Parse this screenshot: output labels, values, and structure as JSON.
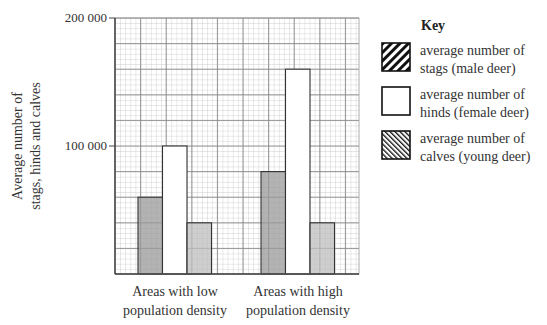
{
  "chart_data": {
    "type": "bar",
    "title": "",
    "xlabel": "",
    "ylabel": "Average number of stags, hinds and calves",
    "ylabel_lines": [
      "Average number of",
      "stags, hinds and calves"
    ],
    "ylim": [
      0,
      200000
    ],
    "yticks": [
      100000,
      200000
    ],
    "ytick_labels": [
      "100 000",
      "200 000"
    ],
    "grid": true,
    "legend_position": "right",
    "categories": [
      "Areas with low population density",
      "Areas with high population density"
    ],
    "category_lines": [
      [
        "Areas with low",
        "population density"
      ],
      [
        "Areas with high",
        "population density"
      ]
    ],
    "series": [
      {
        "name": "average number of stags (male deer)",
        "values": [
          60000,
          80000
        ],
        "fill": "#9a9a9a",
        "pattern": "hatch-forward"
      },
      {
        "name": "average number of hinds (female deer)",
        "values": [
          100000,
          160000
        ],
        "fill": "#ffffff",
        "pattern": "none"
      },
      {
        "name": "average number of calves (young deer)",
        "values": [
          40000,
          40000
        ],
        "fill": "#bdbdbd",
        "pattern": "hatch-back"
      }
    ]
  },
  "key": {
    "title": "Key",
    "items": [
      {
        "line1": "average number of",
        "line2": "stags (male deer)"
      },
      {
        "line1": "average number of",
        "line2": "hinds (female deer)"
      },
      {
        "line1": "average number of",
        "line2": "calves (young deer)"
      }
    ]
  }
}
